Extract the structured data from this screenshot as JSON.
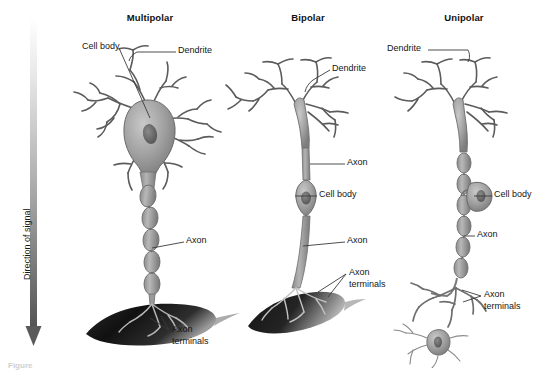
{
  "figure": {
    "background_color": "#ffffff",
    "caption": "Figure",
    "direction_axis": {
      "label": "Direction of signal",
      "arrow_direction": "down",
      "gradient_from": "#ffffff",
      "gradient_to": "#4a4a4a"
    },
    "neuron_fill": "#9a9a9a",
    "neuron_stroke": "#4a4a4a",
    "nucleus_fill": "#6b6b6b",
    "terminal_fill": "#1d1d1d",
    "leader_color": "#3a3a3a"
  },
  "columns": [
    {
      "id": "multipolar",
      "title": "Multipolar",
      "labels": [
        {
          "id": "cell-body",
          "text": "Cell body"
        },
        {
          "id": "dendrite",
          "text": "Dendrite"
        },
        {
          "id": "axon",
          "text": "Axon"
        },
        {
          "id": "axon-terminals-line1",
          "text": "Axon"
        },
        {
          "id": "axon-terminals-line2",
          "text": "terminals"
        }
      ]
    },
    {
      "id": "bipolar",
      "title": "Bipolar",
      "labels": [
        {
          "id": "dendrite",
          "text": "Dendrite"
        },
        {
          "id": "axon-upper",
          "text": "Axon"
        },
        {
          "id": "cell-body",
          "text": "Cell body"
        },
        {
          "id": "axon-lower",
          "text": "Axon"
        },
        {
          "id": "axon-terminals-line1",
          "text": "Axon"
        },
        {
          "id": "axon-terminals-line2",
          "text": "terminals"
        }
      ]
    },
    {
      "id": "unipolar",
      "title": "Unipolar",
      "labels": [
        {
          "id": "dendrite",
          "text": "Dendrite"
        },
        {
          "id": "cell-body",
          "text": "Cell body"
        },
        {
          "id": "axon",
          "text": "Axon"
        },
        {
          "id": "axon-terminals-line1",
          "text": "Axon"
        },
        {
          "id": "axon-terminals-line2",
          "text": "terminals"
        }
      ]
    }
  ]
}
